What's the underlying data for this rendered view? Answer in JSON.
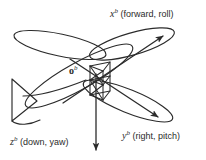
{
  "figure": {
    "background_color": "#ffffff",
    "line_color": "#2b2b2b",
    "origin": {
      "symbol": "o",
      "superscript": "b",
      "name": "body-frame-origin"
    },
    "axes": [
      {
        "id": "x",
        "symbol": "x",
        "superscript": "b",
        "description": "(forward, roll)",
        "direction": "up-right",
        "arrow": true
      },
      {
        "id": "y",
        "symbol": "y",
        "superscript": "b",
        "description": "(right, pitch)",
        "direction": "down-right",
        "arrow": true
      },
      {
        "id": "z",
        "symbol": "z",
        "superscript": "b",
        "description": "(down, yaw)",
        "direction": "down",
        "arrow": true
      }
    ],
    "parts": [
      {
        "name": "fuselage",
        "shape": "elongated-ellipse"
      },
      {
        "name": "left-wing",
        "shape": "elongated-ellipse"
      },
      {
        "name": "right-wing",
        "shape": "elongated-ellipse"
      },
      {
        "name": "tail-fin",
        "shape": "triangle"
      },
      {
        "name": "reference-cube",
        "shape": "wireframe-box"
      }
    ]
  }
}
